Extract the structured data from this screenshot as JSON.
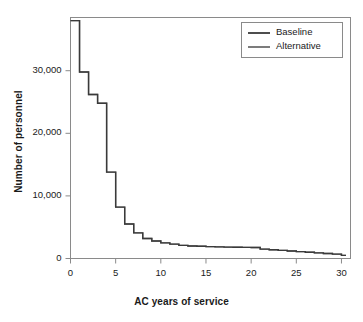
{
  "chart_data": {
    "type": "line",
    "subtype": "step",
    "title": "",
    "xlabel": "AC years of service",
    "ylabel": "Number of personnel",
    "xlim": [
      0,
      31
    ],
    "ylim": [
      0,
      38500
    ],
    "grid": false,
    "legend_position": "top-right",
    "xticks": [
      0,
      5,
      10,
      15,
      20,
      25,
      30
    ],
    "xtick_labels": [
      "0",
      "5",
      "10",
      "15",
      "20",
      "25",
      "30"
    ],
    "yticks": [
      0,
      10000,
      20000,
      30000
    ],
    "ytick_labels": [
      "0",
      "10,000",
      "20,000",
      "30,000"
    ],
    "series": [
      {
        "name": "Baseline",
        "color": "#3a3a3a",
        "x": [
          0,
          1,
          2,
          3,
          4,
          5,
          6,
          7,
          8,
          9,
          10,
          11,
          12,
          13,
          14,
          15,
          16,
          17,
          18,
          19,
          20,
          21,
          22,
          23,
          24,
          25,
          26,
          27,
          28,
          29,
          30
        ],
        "values": [
          38000,
          29800,
          26200,
          24800,
          13800,
          8200,
          5500,
          4100,
          3200,
          2800,
          2500,
          2300,
          2100,
          2000,
          1950,
          1900,
          1850,
          1820,
          1800,
          1780,
          1750,
          1500,
          1400,
          1300,
          1200,
          1100,
          1000,
          900,
          800,
          700,
          500
        ]
      },
      {
        "name": "Alternative",
        "color": "#6e6e6e",
        "x": [
          0,
          1,
          2,
          3,
          4,
          5,
          6,
          7,
          8,
          9,
          10,
          11,
          12,
          13,
          14,
          15,
          16,
          17,
          18,
          19,
          20,
          21,
          22,
          23,
          24,
          25,
          26,
          27,
          28,
          29,
          30
        ],
        "values": [
          38000,
          29800,
          26200,
          24800,
          13800,
          8200,
          5500,
          4100,
          3200,
          2800,
          2500,
          2300,
          2100,
          2000,
          1950,
          1900,
          1850,
          1820,
          1800,
          1780,
          1750,
          1500,
          1400,
          1300,
          1200,
          1100,
          1000,
          900,
          800,
          700,
          500
        ]
      }
    ]
  },
  "legend": {
    "entries": [
      {
        "label": "Baseline"
      },
      {
        "label": "Alternative"
      }
    ]
  }
}
